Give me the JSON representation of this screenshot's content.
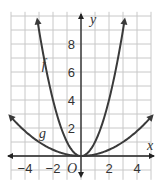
{
  "chart_data": {
    "type": "line",
    "title": "",
    "xlabel": "x",
    "ylabel": "y",
    "origin_label": "O",
    "xlim": [
      -5,
      5
    ],
    "ylim": [
      -1,
      10
    ],
    "grid": true,
    "x_ticks": [
      "-4",
      "-2",
      "2",
      "4"
    ],
    "y_ticks": [
      "2",
      "4",
      "6",
      "8"
    ],
    "series": [
      {
        "name": "f",
        "formula": "y = x^2",
        "x": [
          -3.1,
          -3,
          -2,
          -1,
          0,
          1,
          2,
          3,
          3.1
        ],
        "y": [
          9.6,
          9,
          4,
          1,
          0,
          1,
          4,
          9,
          9.6
        ]
      },
      {
        "name": "g",
        "formula": "y = x^2/9",
        "x": [
          -5,
          -4,
          -3,
          -2,
          -1,
          0,
          1,
          2,
          3,
          4,
          5
        ],
        "y": [
          2.78,
          1.78,
          1,
          0.44,
          0.11,
          0,
          0.11,
          0.44,
          1,
          1.78,
          2.78
        ]
      }
    ],
    "colors": {
      "curve": "#3a3a3a",
      "grid": "#c8c8c8",
      "axis": "#222222"
    }
  }
}
